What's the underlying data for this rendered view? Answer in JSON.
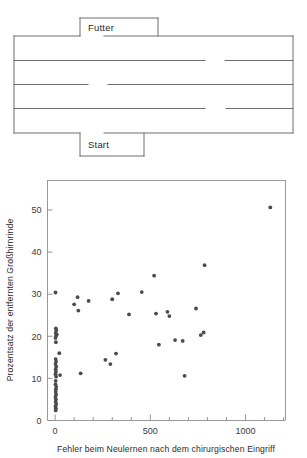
{
  "figure": {
    "maze": {
      "name": "serpentine-maze-diagram",
      "food_label": "Futter",
      "start_label": "Start",
      "rows": 4,
      "outer_color": "#6e6e6e"
    },
    "scatter": {
      "xlabel": "Fehler beim Neulernen nach dem chirurgischen Eingriff",
      "ylabel": "Prozentsatz der entfernten Großhirnrinde",
      "x_ticks": [
        "0",
        "500",
        "1000"
      ],
      "y_ticks": [
        "0",
        "10",
        "20",
        "30",
        "40",
        "50"
      ],
      "point_color": "#4a4a4f"
    }
  },
  "chart_data": {
    "type": "scatter",
    "title": "",
    "xlabel": "Fehler beim Neulernen nach dem chirurgischen Eingriff",
    "ylabel": "Prozentsatz der entfernten Großhirnrinde",
    "xlim": [
      -40,
      1210
    ],
    "ylim": [
      0,
      57
    ],
    "x_major_ticks": [
      0,
      500,
      1000
    ],
    "x_minor_tick_step": 100,
    "y_major_ticks": [
      0,
      10,
      20,
      30,
      40,
      50
    ],
    "grid": false,
    "legend": null,
    "points": [
      [
        2,
        30.4
      ],
      [
        4,
        21.9
      ],
      [
        6,
        21.4
      ],
      [
        3,
        20.8
      ],
      [
        9,
        20.4
      ],
      [
        5,
        20.1
      ],
      [
        2,
        19.6
      ],
      [
        4,
        18.6
      ],
      [
        22,
        16.0
      ],
      [
        3,
        14.6
      ],
      [
        5,
        14.0
      ],
      [
        2,
        13.4
      ],
      [
        6,
        12.8
      ],
      [
        3,
        12.2
      ],
      [
        4,
        11.6
      ],
      [
        2,
        11.0
      ],
      [
        26,
        10.8
      ],
      [
        5,
        10.4
      ],
      [
        3,
        9.4
      ],
      [
        2,
        8.6
      ],
      [
        6,
        8.0
      ],
      [
        4,
        7.4
      ],
      [
        3,
        6.8
      ],
      [
        5,
        6.2
      ],
      [
        2,
        5.6
      ],
      [
        4,
        5.0
      ],
      [
        3,
        4.4
      ],
      [
        6,
        3.9
      ],
      [
        2,
        3.4
      ],
      [
        4,
        2.9
      ],
      [
        3,
        2.4
      ],
      [
        100,
        27.6
      ],
      [
        118,
        29.3
      ],
      [
        122,
        26.1
      ],
      [
        134,
        11.2
      ],
      [
        176,
        28.4
      ],
      [
        264,
        14.4
      ],
      [
        290,
        13.4
      ],
      [
        300,
        28.8
      ],
      [
        320,
        15.9
      ],
      [
        330,
        30.2
      ],
      [
        388,
        25.2
      ],
      [
        455,
        30.5
      ],
      [
        520,
        34.4
      ],
      [
        530,
        25.4
      ],
      [
        545,
        18.0
      ],
      [
        590,
        25.8
      ],
      [
        600,
        24.8
      ],
      [
        630,
        19.1
      ],
      [
        670,
        18.9
      ],
      [
        680,
        10.6
      ],
      [
        740,
        26.6
      ],
      [
        765,
        20.3
      ],
      [
        780,
        20.9
      ],
      [
        785,
        36.9
      ],
      [
        1130,
        50.6
      ]
    ]
  }
}
